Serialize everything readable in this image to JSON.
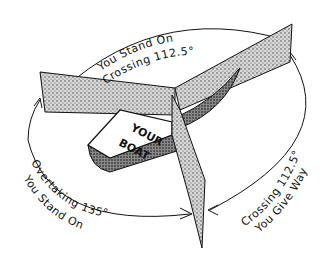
{
  "diagram": {
    "boat_label_line1": "YOUR",
    "boat_label_line2": "BOAT",
    "sectors": [
      {
        "name": "crossing-starboard",
        "line1": "You Stand On",
        "line2": "Crossing 112.5°"
      },
      {
        "name": "crossing-port",
        "line1": "Crossing 112.5°",
        "line2": "You Give Way"
      },
      {
        "name": "overtaking",
        "line1": "Overtaking 135°",
        "line2": "You Stand On"
      }
    ],
    "colors": {
      "ink": "#111111",
      "stipple": "#9a9a9a",
      "background": "#ffffff"
    }
  }
}
